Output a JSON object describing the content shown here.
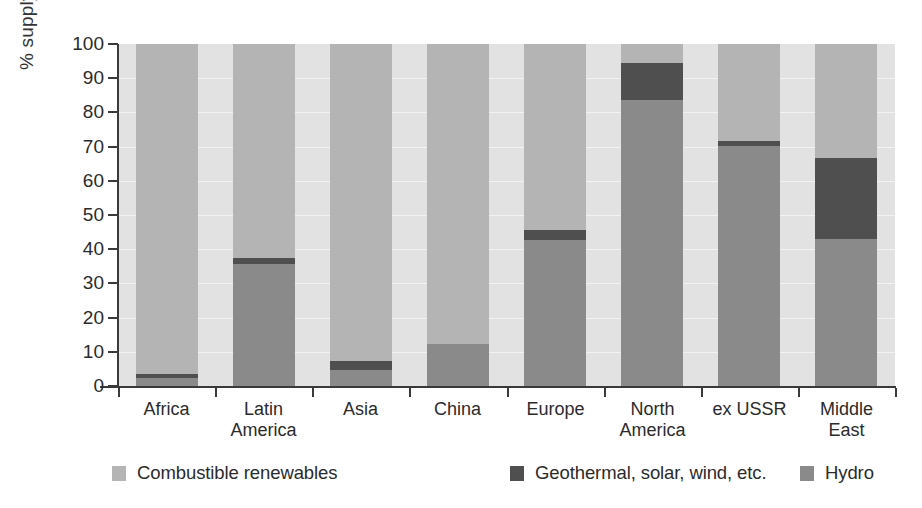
{
  "chart_data": {
    "type": "bar",
    "stacked": true,
    "title": "",
    "xlabel": "",
    "ylabel": "% supply",
    "ylim": [
      0,
      100
    ],
    "ytick_values": [
      0,
      10,
      20,
      30,
      40,
      50,
      60,
      70,
      80,
      90,
      100
    ],
    "ytick_labels": [
      "0",
      "10",
      "20",
      "30",
      "40",
      "50",
      "60",
      "70",
      "80",
      "90",
      "100"
    ],
    "grid": true,
    "legend_position": "bottom",
    "categories": [
      "Africa",
      "Latin\nAmerica",
      "Asia",
      "China",
      "Europe",
      "North\nAmerica",
      "ex USSR",
      "Middle\nEast"
    ],
    "series": [
      {
        "name": "Hydro",
        "color": "#8a8a8a",
        "values": [
          2.3,
          35.7,
          4.7,
          12.3,
          42.7,
          83.6,
          70.2,
          43.0
        ]
      },
      {
        "name": "Geothermal, solar, wind, etc.",
        "color": "#4f4f4f",
        "values": [
          1.2,
          1.7,
          2.6,
          0.0,
          2.9,
          10.8,
          1.4,
          23.7
        ]
      },
      {
        "name": "Combustible renewables",
        "color": "#b4b4b4",
        "values": [
          96.5,
          62.6,
          92.7,
          87.7,
          54.4,
          5.6,
          28.4,
          33.3
        ]
      }
    ],
    "plot_background": "#e2e2e2"
  },
  "legend": {
    "items": [
      {
        "label": "Combustible renewables",
        "color": "#b4b4b4"
      },
      {
        "label": "Geothermal, solar, wind, etc.",
        "color": "#4f4f4f"
      },
      {
        "label": "Hydro",
        "color": "#8a8a8a"
      }
    ]
  },
  "axis": {
    "y_title": "% supply"
  }
}
